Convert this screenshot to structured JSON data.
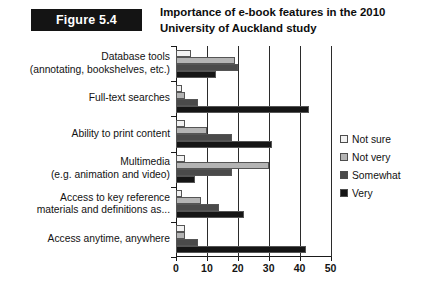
{
  "figure": {
    "badge_label": "Figure 5.4",
    "title_line_1": "Importance of e-book features in the 2010",
    "title_line_2": "University of Auckland study"
  },
  "chart_data": {
    "type": "bar",
    "orientation": "horizontal",
    "title": "Importance of e-book features in the 2010 University of Auckland study",
    "xlabel": "",
    "ylabel": "",
    "xlim": [
      0,
      50
    ],
    "xticks": [
      0,
      10,
      20,
      30,
      40,
      50
    ],
    "xtick_labels": [
      "0",
      "10",
      "20",
      "30",
      "40",
      "50"
    ],
    "grid": true,
    "legend_position": "right",
    "categories": [
      "Database tools (annotating, bookshelves, etc.)",
      "Full-text searches",
      "Ability to print content",
      "Multimedia (e.g. animation and video)",
      "Access to key reference materials and definitions as...",
      "Access anytime, anywhere"
    ],
    "category_lines": [
      [
        "Database tools",
        "(annotating, bookshelves, etc.)"
      ],
      [
        "Full-text searches"
      ],
      [
        "Ability to print content"
      ],
      [
        "Multimedia",
        "(e.g. animation and video)"
      ],
      [
        "Access to key reference",
        "materials and definitions as..."
      ],
      [
        "Access anytime, anywhere"
      ]
    ],
    "series": [
      {
        "name": "Not sure",
        "color": "#f2f2f2",
        "values": [
          5,
          2,
          3,
          3,
          2,
          3
        ]
      },
      {
        "name": "Not very",
        "color": "#b4b4b4",
        "values": [
          19,
          3,
          10,
          30,
          8,
          3
        ]
      },
      {
        "name": "Somewhat",
        "color": "#4a4a4a",
        "values": [
          20,
          7,
          18,
          18,
          14,
          7
        ]
      },
      {
        "name": "Very",
        "color": "#151515",
        "values": [
          13,
          43,
          31,
          6,
          22,
          42
        ]
      }
    ]
  },
  "legend": {
    "items": [
      {
        "label": "Not sure"
      },
      {
        "label": "Not very"
      },
      {
        "label": "Somewhat"
      },
      {
        "label": "Very"
      }
    ]
  }
}
